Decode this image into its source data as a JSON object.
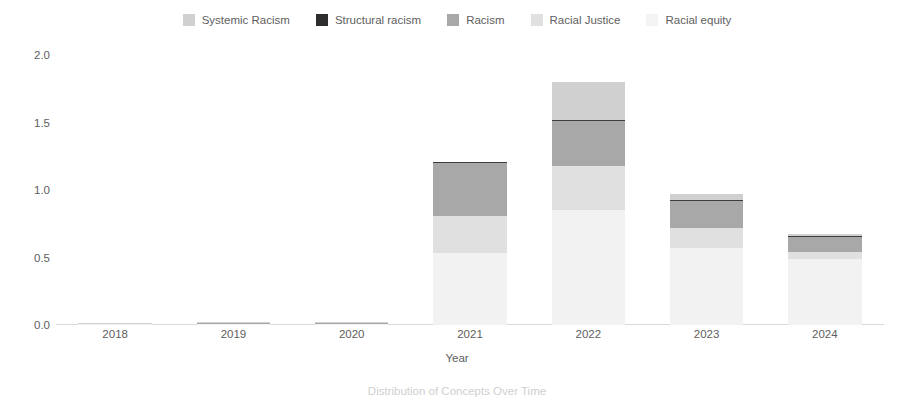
{
  "chart_data": {
    "type": "bar",
    "stacked": true,
    "title": "",
    "xlabel": "Year",
    "ylabel": "",
    "categories": [
      "2018",
      "2019",
      "2020",
      "2021",
      "2022",
      "2023",
      "2024"
    ],
    "ylim": [
      0.0,
      2.0
    ],
    "yticks": [
      0.0,
      0.5,
      1.0,
      1.5,
      2.0
    ],
    "ytick_labels": [
      "0.0",
      "0.5",
      "1.0",
      "1.5",
      "2.0"
    ],
    "grid": false,
    "legend_position": "top-center",
    "series": [
      {
        "name": "Racial equity",
        "color": "#f2f2f2",
        "values": [
          0.004,
          0.006,
          0.006,
          0.53,
          0.85,
          0.57,
          0.49
        ]
      },
      {
        "name": "Racial Justice",
        "color": "#e0e0e0",
        "values": [
          0.002,
          0.004,
          0.004,
          0.28,
          0.33,
          0.15,
          0.05
        ]
      },
      {
        "name": "Racism",
        "color": "#a8a8a8",
        "values": [
          0.003,
          0.005,
          0.004,
          0.39,
          0.33,
          0.2,
          0.11
        ]
      },
      {
        "name": "Structural racism",
        "color": "#3d3d3d",
        "values": [
          0.0005,
          0.001,
          0.001,
          0.005,
          0.01,
          0.008,
          0.006
        ]
      },
      {
        "name": "Systemic Racism",
        "color": "#d0d0d0",
        "values": [
          0.001,
          0.003,
          0.003,
          0.0,
          0.28,
          0.04,
          0.02
        ]
      }
    ],
    "totals": [
      0.011,
      0.019,
      0.018,
      1.2,
      1.8,
      0.97,
      0.68
    ],
    "annotations": []
  },
  "legend": {
    "items": [
      {
        "label": "Systemic Racism",
        "swatch": "#d0d0d0"
      },
      {
        "label": "Structural racism",
        "swatch": "#2e2e2e"
      },
      {
        "label": "Racism",
        "swatch": "#a8a8a8"
      },
      {
        "label": "Racial Justice",
        "swatch": "#e0e0e0"
      },
      {
        "label": "Racial equity",
        "swatch": "#f4f4f4"
      }
    ]
  },
  "axes": {
    "x_title": "Year",
    "y_tick_labels": [
      "0.0",
      "0.5",
      "1.0",
      "1.5",
      "2.0"
    ],
    "x_tick_labels": [
      "2018",
      "2019",
      "2020",
      "2021",
      "2022",
      "2023",
      "2024"
    ]
  },
  "caption": {
    "text": "Distribution of Concepts Over Time"
  },
  "colors": {
    "axis": "#d9d9d9",
    "text": "#5e5e5e",
    "background": "#ffffff"
  }
}
